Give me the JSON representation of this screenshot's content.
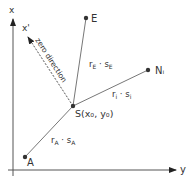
{
  "diagram": {
    "axes": {
      "x_label": "x",
      "y_label": "y",
      "x_prime_label": "x'"
    },
    "zero_direction_label": "zero direction",
    "points": {
      "S": {
        "label": "S(x₀, y₀)"
      },
      "E": {
        "label": "E"
      },
      "N": {
        "label": "Nᵢ"
      },
      "A": {
        "label": "A"
      }
    },
    "segments": {
      "SE": {
        "label": "r_E · s_E",
        "r": "r",
        "r_sub": "E",
        "s": "s",
        "s_sub": "E"
      },
      "SN": {
        "label": "r_i · s_i",
        "r": "r",
        "r_sub": "i",
        "s": "s",
        "s_sub": "i"
      },
      "SA": {
        "label": "r_A · s_A",
        "r": "r",
        "r_sub": "A",
        "s": "s",
        "s_sub": "A"
      }
    },
    "colors": {
      "line": "#555555",
      "point": "#333333",
      "text": "#333333"
    }
  }
}
